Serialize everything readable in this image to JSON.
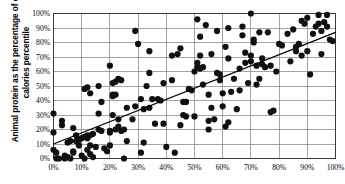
{
  "chart_data": {
    "type": "scatter",
    "title": "",
    "subtitle": "",
    "xlabel": "",
    "ylabel": "Animal protein as the percentage of daily calories percentile",
    "xlim": [
      0,
      100
    ],
    "ylim": [
      0,
      100
    ],
    "grid": true,
    "legend": "none",
    "x_ticks": [
      "0%",
      "10%",
      "20%",
      "30%",
      "40%",
      "50%",
      "60%",
      "70%",
      "80%",
      "90%",
      "100%"
    ],
    "y_ticks": [
      "0%",
      "10%",
      "20%",
      "30%",
      "40%",
      "50%",
      "60%",
      "70%",
      "80%",
      "90%",
      "100%"
    ],
    "x_tick_values": [
      0,
      10,
      20,
      30,
      40,
      50,
      60,
      70,
      80,
      90,
      100
    ],
    "y_tick_values": [
      0,
      10,
      20,
      30,
      40,
      50,
      60,
      70,
      80,
      90,
      100
    ],
    "marker_color": "#101010",
    "marker_size": 3.1,
    "trendline": {
      "label": "linear fit",
      "color": "#000000",
      "x_start": 0,
      "y_start": 10,
      "x_end": 100,
      "y_end": 87
    },
    "series": [
      {
        "name": "countries",
        "points": [
          [
            0,
            31
          ],
          [
            0,
            18
          ],
          [
            0,
            6
          ],
          [
            1,
            4
          ],
          [
            1,
            0
          ],
          [
            2,
            0
          ],
          [
            3,
            23
          ],
          [
            3,
            26
          ],
          [
            4,
            2
          ],
          [
            4,
            0
          ],
          [
            5,
            1
          ],
          [
            5,
            11
          ],
          [
            6,
            12
          ],
          [
            6,
            0
          ],
          [
            7,
            21
          ],
          [
            7,
            5
          ],
          [
            7,
            4
          ],
          [
            8,
            16
          ],
          [
            8,
            12
          ],
          [
            9,
            13
          ],
          [
            9,
            9
          ],
          [
            10,
            14
          ],
          [
            10,
            2
          ],
          [
            11,
            48
          ],
          [
            11,
            15
          ],
          [
            11,
            0
          ],
          [
            12,
            49
          ],
          [
            12,
            16
          ],
          [
            12,
            14
          ],
          [
            12,
            6
          ],
          [
            13,
            45
          ],
          [
            13,
            16
          ],
          [
            13,
            9
          ],
          [
            13,
            3
          ],
          [
            14,
            17
          ],
          [
            14,
            1
          ],
          [
            15,
            8
          ],
          [
            16,
            31
          ],
          [
            16,
            50
          ],
          [
            16,
            20
          ],
          [
            17,
            39
          ],
          [
            17,
            19
          ],
          [
            18,
            7
          ],
          [
            19,
            5
          ],
          [
            20,
            64
          ],
          [
            20,
            19
          ],
          [
            20,
            18
          ],
          [
            20,
            9
          ],
          [
            21,
            52
          ],
          [
            21,
            44
          ],
          [
            21,
            43
          ],
          [
            21,
            30
          ],
          [
            22,
            53
          ],
          [
            22,
            44
          ],
          [
            22,
            20
          ],
          [
            23,
            55
          ],
          [
            23,
            27
          ],
          [
            23,
            22
          ],
          [
            24,
            54
          ],
          [
            24,
            19
          ],
          [
            25,
            20
          ],
          [
            25,
            0
          ],
          [
            26,
            35
          ],
          [
            26,
            12
          ],
          [
            28,
            27
          ],
          [
            29,
            88
          ],
          [
            29,
            36
          ],
          [
            30,
            79
          ],
          [
            31,
            41
          ],
          [
            31,
            4
          ],
          [
            32,
            34
          ],
          [
            32,
            11
          ],
          [
            33,
            50
          ],
          [
            34,
            74
          ],
          [
            34,
            59
          ],
          [
            34,
            35
          ],
          [
            35,
            41
          ],
          [
            36,
            24
          ],
          [
            37,
            41
          ],
          [
            38,
            40
          ],
          [
            39,
            52
          ],
          [
            39,
            24
          ],
          [
            40,
            8
          ],
          [
            42,
            71
          ],
          [
            42,
            54
          ],
          [
            43,
            4
          ],
          [
            44,
            72
          ],
          [
            45,
            76
          ],
          [
            45,
            23
          ],
          [
            46,
            39
          ],
          [
            46,
            30
          ],
          [
            47,
            29
          ],
          [
            47,
            39
          ],
          [
            48,
            48
          ],
          [
            49,
            47
          ],
          [
            50,
            60
          ],
          [
            50,
            29
          ],
          [
            51,
            66
          ],
          [
            51,
            63
          ],
          [
            51,
            96
          ],
          [
            52,
            84
          ],
          [
            52,
            71
          ],
          [
            52,
            62
          ],
          [
            53,
            63
          ],
          [
            53,
            51
          ],
          [
            54,
            92
          ],
          [
            55,
            20
          ],
          [
            55,
            26
          ],
          [
            55,
            44
          ],
          [
            56,
            72
          ],
          [
            56,
            35
          ],
          [
            57,
            27
          ],
          [
            58,
            59
          ],
          [
            58,
            88
          ],
          [
            59,
            58
          ],
          [
            59,
            54
          ],
          [
            60,
            36
          ],
          [
            60,
            45
          ],
          [
            61,
            77
          ],
          [
            61,
            22
          ],
          [
            62,
            69
          ],
          [
            62,
            25
          ],
          [
            62,
            90
          ],
          [
            63,
            46
          ],
          [
            64,
            55
          ],
          [
            65,
            34
          ],
          [
            66,
            47
          ],
          [
            66,
            62
          ],
          [
            67,
            85
          ],
          [
            67,
            91
          ],
          [
            68,
            73
          ],
          [
            68,
            66
          ],
          [
            69,
            52
          ],
          [
            70,
            67
          ],
          [
            70,
            71
          ],
          [
            70,
            100
          ],
          [
            71,
            80
          ],
          [
            71,
            82
          ],
          [
            72,
            51
          ],
          [
            72,
            64
          ],
          [
            73,
            55
          ],
          [
            73,
            87
          ],
          [
            74,
            69
          ],
          [
            74,
            65
          ],
          [
            75,
            63
          ],
          [
            76,
            87
          ],
          [
            77,
            64
          ],
          [
            77,
            32
          ],
          [
            78,
            33
          ],
          [
            79,
            60
          ],
          [
            80,
            79
          ],
          [
            81,
            78
          ],
          [
            83,
            86
          ],
          [
            84,
            67
          ],
          [
            85,
            89
          ],
          [
            86,
            77
          ],
          [
            86,
            74
          ],
          [
            87,
            79
          ],
          [
            88,
            95
          ],
          [
            88,
            71
          ],
          [
            89,
            93
          ],
          [
            90,
            97
          ],
          [
            90,
            74
          ],
          [
            91,
            58
          ],
          [
            92,
            86
          ],
          [
            93,
            91
          ],
          [
            94,
            99
          ],
          [
            94,
            93
          ],
          [
            95,
            88
          ],
          [
            95,
            72
          ],
          [
            96,
            94
          ],
          [
            97,
            99
          ],
          [
            97,
            91
          ],
          [
            98,
            82
          ],
          [
            99,
            81
          ]
        ]
      }
    ]
  }
}
